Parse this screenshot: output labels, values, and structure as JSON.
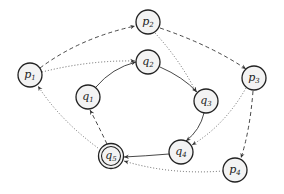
{
  "diagram": {
    "type": "state-graph",
    "nodes": [
      {
        "id": "p1",
        "base": "p",
        "sub": "1",
        "x": 30,
        "y": 75,
        "accepting": false
      },
      {
        "id": "p2",
        "base": "p",
        "sub": "2",
        "x": 148,
        "y": 22,
        "accepting": false
      },
      {
        "id": "p3",
        "base": "p",
        "sub": "3",
        "x": 254,
        "y": 78,
        "accepting": false
      },
      {
        "id": "p4",
        "base": "p",
        "sub": "4",
        "x": 235,
        "y": 170,
        "accepting": false
      },
      {
        "id": "q1",
        "base": "q",
        "sub": "1",
        "x": 88,
        "y": 97,
        "accepting": false
      },
      {
        "id": "q2",
        "base": "q",
        "sub": "2",
        "x": 148,
        "y": 62,
        "accepting": false
      },
      {
        "id": "q3",
        "base": "q",
        "sub": "3",
        "x": 206,
        "y": 101,
        "accepting": false
      },
      {
        "id": "q4",
        "base": "q",
        "sub": "4",
        "x": 181,
        "y": 152,
        "accepting": false
      },
      {
        "id": "q5",
        "base": "q",
        "sub": "5",
        "x": 111,
        "y": 156,
        "accepting": true
      }
    ],
    "edges": [
      {
        "from": "q1",
        "to": "q2",
        "style": "solid"
      },
      {
        "from": "q2",
        "to": "q3",
        "style": "solid"
      },
      {
        "from": "q3",
        "to": "q4",
        "style": "solid"
      },
      {
        "from": "q4",
        "to": "q5",
        "style": "solid"
      },
      {
        "from": "q5",
        "to": "q1",
        "style": "dashed"
      },
      {
        "from": "p1",
        "to": "p2",
        "style": "dashed"
      },
      {
        "from": "p2",
        "to": "p3",
        "style": "dashed"
      },
      {
        "from": "p3",
        "to": "p4",
        "style": "dashed"
      },
      {
        "from": "p1",
        "to": "q2",
        "style": "dotted"
      },
      {
        "from": "p2",
        "to": "q3",
        "style": "dotted"
      },
      {
        "from": "p3",
        "to": "q4",
        "style": "dotted"
      },
      {
        "from": "p4",
        "to": "q5",
        "style": "dotted"
      },
      {
        "from": "q5",
        "to": "p1",
        "style": "dotted"
      }
    ],
    "colors": {
      "node_fill": "#f3f3f3",
      "node_stroke": "#222222",
      "edge": "#333333"
    }
  },
  "labels": {
    "p1": {
      "base": "p",
      "sub": "1"
    },
    "p2": {
      "base": "p",
      "sub": "2"
    },
    "p3": {
      "base": "p",
      "sub": "3"
    },
    "p4": {
      "base": "p",
      "sub": "4"
    },
    "q1": {
      "base": "q",
      "sub": "1"
    },
    "q2": {
      "base": "q",
      "sub": "2"
    },
    "q3": {
      "base": "q",
      "sub": "3"
    },
    "q4": {
      "base": "q",
      "sub": "4"
    },
    "q5": {
      "base": "q",
      "sub": "5"
    }
  }
}
